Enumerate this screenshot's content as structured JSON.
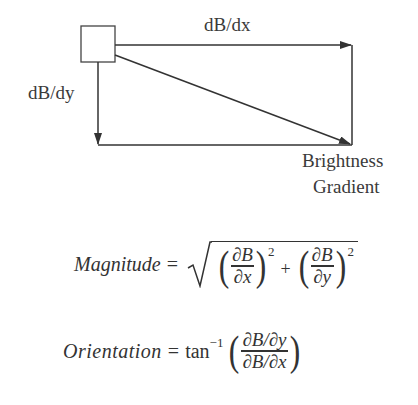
{
  "diagram": {
    "label_dx": "dB/dx",
    "label_dy": "dB/dy",
    "result_label_line1": "Brightness",
    "result_label_line2": "Gradient",
    "stroke_color": "#333333"
  },
  "formulas": {
    "magnitude": {
      "lhs": "Magnitude",
      "equals": "=",
      "term1_num": "∂B",
      "term1_den": "∂x",
      "term2_num": "∂B",
      "term2_den": "∂y",
      "exponent": "2",
      "plus": "+"
    },
    "orientation": {
      "lhs": "Orientation",
      "equals": "=",
      "func": "tan",
      "func_sup": "−1",
      "num": "∂B/∂y",
      "den": "∂B/∂x"
    }
  }
}
